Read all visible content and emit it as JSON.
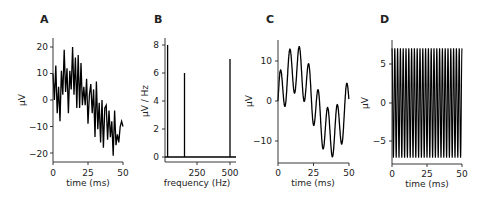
{
  "chart_data": [
    {
      "panel": "A",
      "type": "line",
      "title": "A",
      "xlabel": "time (ms)",
      "ylabel": "µV",
      "xlim": [
        0,
        50
      ],
      "ylim": [
        -23,
        23
      ],
      "xticks": [
        0,
        25,
        50
      ],
      "yticks": [
        -20,
        -10,
        0,
        10,
        20
      ],
      "grid": false,
      "description": "Noisy signal: sum of 20 Hz, 150 Hz, 500 Hz sines plus noise, drifting from ~+8 to ~-8",
      "x": [
        0,
        1,
        2,
        3,
        4,
        5,
        6,
        7,
        8,
        9,
        10,
        11,
        12,
        13,
        14,
        15,
        16,
        17,
        18,
        19,
        20,
        21,
        22,
        23,
        24,
        25,
        26,
        27,
        28,
        29,
        30,
        31,
        32,
        33,
        34,
        35,
        36,
        37,
        38,
        39,
        40,
        41,
        42,
        43,
        44,
        45,
        46,
        47,
        48,
        49,
        50
      ],
      "y": [
        10,
        0,
        13,
        -5,
        5,
        -8,
        11,
        2,
        19,
        3,
        12,
        -5,
        11,
        4,
        20,
        2,
        16,
        -3,
        17,
        -3,
        14,
        -2,
        5,
        -2,
        8,
        -9,
        2,
        6,
        -5,
        4,
        -14,
        7,
        -11,
        -1,
        -16,
        0,
        -18,
        -3,
        -2,
        -15,
        -4,
        -14,
        -8,
        -21,
        -4,
        -17,
        -13,
        -16,
        -10,
        -8,
        -10
      ]
    },
    {
      "panel": "B",
      "type": "line",
      "title": "B",
      "xlabel": "frequency (Hz)",
      "ylabel": "µV / Hz",
      "xlim": [
        0,
        530
      ],
      "ylim": [
        -0.3,
        8.4
      ],
      "xticks": [
        250,
        500
      ],
      "yticks": [
        0,
        2,
        4,
        6,
        8
      ],
      "grid": false,
      "description": "Amplitude spectrum with peaks at 20, 150 and 500 Hz",
      "peaks": [
        {
          "frequency": 20,
          "amplitude": 8
        },
        {
          "frequency": 150,
          "amplitude": 6
        },
        {
          "frequency": 500,
          "amplitude": 7
        }
      ]
    },
    {
      "panel": "C",
      "type": "line",
      "title": "C",
      "xlabel": "time (ms)",
      "ylabel": "µV",
      "xlim": [
        0,
        50
      ],
      "ylim": [
        -15.5,
        15.5
      ],
      "xticks": [
        0,
        25,
        50
      ],
      "yticks": [
        -10,
        0,
        10
      ],
      "grid": false,
      "description": "Filtered signal: 20 Hz (amp 8) + 150 Hz (amp 6) components",
      "components": [
        {
          "frequency_hz": 20,
          "amplitude": 8
        },
        {
          "frequency_hz": 150,
          "amplitude": 6
        }
      ]
    },
    {
      "panel": "D",
      "type": "line",
      "title": "D",
      "xlabel": "time (ms)",
      "ylabel": "µV",
      "xlim": [
        0,
        50
      ],
      "ylim": [
        -8,
        8
      ],
      "xticks": [
        0,
        25,
        50
      ],
      "yticks": [
        -5,
        0,
        5
      ],
      "grid": false,
      "description": "500 Hz component isolated, amplitude 7",
      "components": [
        {
          "frequency_hz": 500,
          "amplitude": 7
        }
      ]
    }
  ],
  "panels": {
    "A": {
      "label": "A",
      "xlabel": "time (ms)",
      "ylabel": "µV",
      "xticks": [
        "0",
        "25",
        "50"
      ],
      "yticks": [
        "20",
        "10",
        "0",
        "−10",
        "−20"
      ]
    },
    "B": {
      "label": "B",
      "xlabel": "frequency (Hz)",
      "ylabel": "µV / Hz",
      "xticks": [
        "250",
        "500"
      ],
      "yticks": [
        "8",
        "6",
        "4",
        "2",
        "0"
      ]
    },
    "C": {
      "label": "C",
      "xlabel": "time (ms)",
      "ylabel": "µV",
      "xticks": [
        "0",
        "25",
        "50"
      ],
      "yticks": [
        "10",
        "0",
        "−10"
      ]
    },
    "D": {
      "label": "D",
      "xlabel": "time (ms)",
      "ylabel": "µV",
      "xticks": [
        "0",
        "25",
        "50"
      ],
      "yticks": [
        "5",
        "0",
        "−5"
      ]
    }
  },
  "colors": {
    "line": "#000000",
    "axis": "#222222",
    "text": "#222222"
  }
}
